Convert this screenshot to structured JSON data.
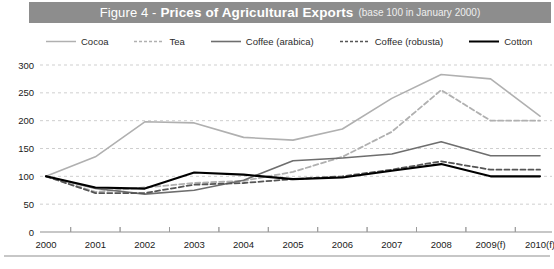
{
  "title": {
    "prefix": "Figure 4 -",
    "main": "Prices of Agricultural Exports",
    "note": "(base 100 in January 2000)",
    "bar_color": "#8d8d8d",
    "text_color": "#ffffff"
  },
  "legend": {
    "position": "top",
    "items": [
      {
        "label": "Cocoa",
        "color": "#b0b0b0",
        "style": "solid",
        "width": 1.5,
        "icon": "line-swatch-icon"
      },
      {
        "label": "Tea",
        "color": "#b0b0b0",
        "style": "dashed",
        "width": 1.5,
        "icon": "line-swatch-icon"
      },
      {
        "label": "Coffee (arabica)",
        "color": "#6e6e6e",
        "style": "solid",
        "width": 1.6,
        "icon": "line-swatch-icon"
      },
      {
        "label": "Coffee (robusta)",
        "color": "#555555",
        "style": "dashed",
        "width": 1.6,
        "icon": "line-swatch-icon"
      },
      {
        "label": "Cotton",
        "color": "#000000",
        "style": "solid",
        "width": 2.0,
        "icon": "line-swatch-icon"
      }
    ]
  },
  "chart_data": {
    "type": "line",
    "title": "Figure 4 - Prices of Agricultural Exports (base 100 in January 2000)",
    "xlabel": "",
    "ylabel": "",
    "ylim": [
      0,
      300
    ],
    "yticks": [
      0,
      50,
      100,
      150,
      200,
      250,
      300
    ],
    "grid": true,
    "grid_style": "dashed-horizontal",
    "legend_position": "top",
    "categories": [
      "2000",
      "2001",
      "2002",
      "2003",
      "2004",
      "2005",
      "2006",
      "2007",
      "2008",
      "2009(f)",
      "2010(f)"
    ],
    "x": [
      "2000",
      "2001",
      "2002",
      "2003",
      "2004",
      "2005",
      "2006",
      "2007",
      "2008",
      "2009(f)",
      "2010(f)"
    ],
    "series": [
      {
        "name": "Cocoa",
        "color": "#b0b0b0",
        "style": "solid",
        "values": [
          100,
          135,
          198,
          196,
          170,
          165,
          185,
          240,
          283,
          275,
          208
        ]
      },
      {
        "name": "Tea",
        "color": "#b0b0b0",
        "style": "dashed",
        "values": [
          100,
          72,
          80,
          88,
          92,
          108,
          135,
          180,
          255,
          200,
          200
        ]
      },
      {
        "name": "Coffee (arabica)",
        "color": "#6e6e6e",
        "style": "solid",
        "values": [
          100,
          78,
          68,
          75,
          93,
          128,
          133,
          140,
          162,
          137,
          137
        ]
      },
      {
        "name": "Coffee (robusta)",
        "color": "#555555",
        "style": "dashed",
        "values": [
          100,
          70,
          70,
          85,
          88,
          95,
          100,
          112,
          127,
          112,
          112
        ]
      },
      {
        "name": "Cotton",
        "color": "#000000",
        "style": "solid",
        "values": [
          100,
          80,
          78,
          107,
          103,
          95,
          98,
          110,
          122,
          100,
          100
        ]
      }
    ]
  },
  "axes": {
    "y_tick_labels": [
      "300",
      "250",
      "200",
      "150",
      "100",
      "50",
      "0"
    ],
    "x_tick_labels": [
      "2000",
      "2001",
      "2002",
      "2003",
      "2004",
      "2005",
      "2006",
      "2007",
      "2008",
      "2009(f)",
      "2010(f)"
    ]
  }
}
